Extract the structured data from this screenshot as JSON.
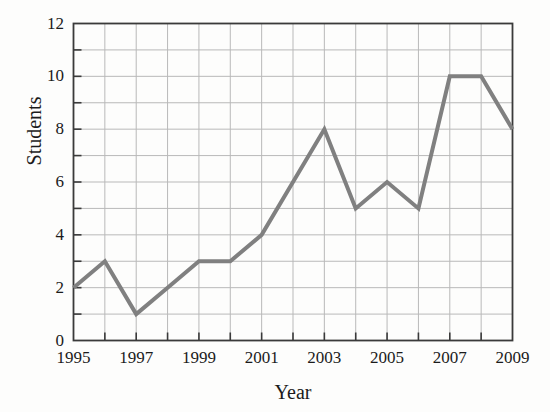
{
  "chart_data": {
    "type": "line",
    "title": "",
    "xlabel": "Year",
    "ylabel": "Students",
    "x": [
      1995,
      1996,
      1997,
      1998,
      1999,
      2000,
      2001,
      2002,
      2003,
      2004,
      2005,
      2006,
      2007,
      2008,
      2009
    ],
    "values": [
      2,
      3,
      1,
      2,
      3,
      3,
      4,
      6,
      8,
      5,
      6,
      5,
      10,
      10,
      8
    ],
    "series": [
      {
        "name": "Students",
        "values": [
          2,
          3,
          1,
          2,
          3,
          3,
          4,
          6,
          8,
          5,
          6,
          5,
          10,
          10,
          8
        ]
      }
    ],
    "xlim": [
      1995,
      2009
    ],
    "ylim": [
      0,
      12
    ],
    "x_tick_labels": [
      "1995",
      "1997",
      "1999",
      "2001",
      "2003",
      "2005",
      "2007",
      "2009"
    ],
    "x_tick_values": [
      1995,
      1997,
      1999,
      2001,
      2003,
      2005,
      2007,
      2009
    ],
    "x_minor_step": 1,
    "y_tick_labels": [
      "0",
      "2",
      "4",
      "6",
      "8",
      "10",
      "12"
    ],
    "y_tick_values": [
      0,
      2,
      4,
      6,
      8,
      10,
      12
    ],
    "y_minor_step": 1,
    "grid": true,
    "grid_axes": "both",
    "legend": false,
    "legend_position": "none",
    "line_color": "#808080",
    "line_width": 4,
    "grid_color": "#b9b9b9",
    "frame_color": "#3a3a3a",
    "background_color": "#fdfdfc",
    "markers": false,
    "annotations": []
  }
}
